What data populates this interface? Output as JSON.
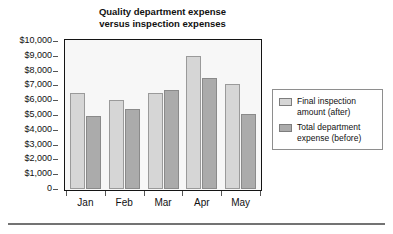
{
  "chart_data": {
    "type": "bar",
    "title": "Quality department expense versus inspection expenses",
    "title_lines": [
      "Quality department expense",
      "versus inspection expenses"
    ],
    "xlabel": "",
    "ylabel": "",
    "categories": [
      "Jan",
      "Feb",
      "Mar",
      "Apr",
      "May"
    ],
    "series": [
      {
        "name": "Final inspection amount (after)",
        "name_lines": [
          "Final inspection",
          "amount (after)"
        ],
        "color": "#d6d6d6",
        "values": [
          6500,
          6000,
          6500,
          9000,
          7100
        ]
      },
      {
        "name": "Total department expense (before)",
        "name_lines": [
          "Total department",
          "expense (before)"
        ],
        "color": "#ababab",
        "values": [
          4900,
          5400,
          6700,
          7500,
          5100
        ]
      }
    ],
    "ylim": [
      0,
      10000
    ],
    "ytick_step": 1000,
    "ytick_labels": [
      "$10,000",
      "$9,000",
      "$8,000",
      "$7,000",
      "$6,000",
      "$5,000",
      "$4,000",
      "$3,000",
      "$2,000",
      "$1,000",
      "0"
    ],
    "ytick_values": [
      10000,
      9000,
      8000,
      7000,
      6000,
      5000,
      4000,
      3000,
      2000,
      1000,
      0
    ],
    "grid": false,
    "legend_position": "right",
    "plot_background": "#f7f7f7",
    "frame_color": "#141414"
  }
}
